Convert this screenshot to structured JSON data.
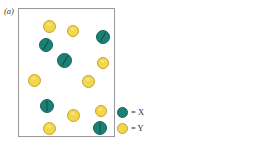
{
  "figure": {
    "type": "particle-distribution-diagram",
    "panels": [
      {
        "id": "a",
        "label": "(a)",
        "particles": [
          {
            "species": "Y",
            "x": 24,
            "y": 11,
            "d": 13,
            "slash": null
          },
          {
            "species": "Y",
            "x": 48,
            "y": 16,
            "d": 12,
            "slash": null
          },
          {
            "species": "X",
            "x": 77,
            "y": 21,
            "d": 14,
            "slash": "slash-r"
          },
          {
            "species": "X",
            "x": 20,
            "y": 29,
            "d": 14,
            "slash": "slash-r"
          },
          {
            "species": "X",
            "x": 38,
            "y": 44,
            "d": 15,
            "slash": "slash-r"
          },
          {
            "species": "Y",
            "x": 78,
            "y": 48,
            "d": 12,
            "slash": null
          },
          {
            "species": "Y",
            "x": 9,
            "y": 65,
            "d": 13,
            "slash": null
          },
          {
            "species": "Y",
            "x": 63,
            "y": 66,
            "d": 13,
            "slash": null
          },
          {
            "species": "X",
            "x": 21,
            "y": 90,
            "d": 14,
            "slash": "slash-v"
          },
          {
            "species": "Y",
            "x": 48,
            "y": 100,
            "d": 13,
            "slash": null
          },
          {
            "species": "Y",
            "x": 76,
            "y": 96,
            "d": 12,
            "slash": null
          },
          {
            "species": "Y",
            "x": 24,
            "y": 113,
            "d": 13,
            "slash": null
          },
          {
            "species": "X",
            "x": 74,
            "y": 112,
            "d": 14,
            "slash": "slash-v"
          }
        ],
        "counts": {
          "X": 5,
          "Y": 8
        }
      },
      {
        "id": "b",
        "label": "(b)",
        "particles": [
          {
            "species": "Y",
            "x": 6,
            "y": 11,
            "d": 13,
            "slash": null
          },
          {
            "species": "Y",
            "x": 33,
            "y": 6,
            "d": 13,
            "slash": null
          },
          {
            "species": "Y",
            "x": 73,
            "y": 8,
            "d": 13,
            "slash": null
          },
          {
            "species": "Y",
            "x": 27,
            "y": 24,
            "d": 13,
            "slash": null
          },
          {
            "species": "X",
            "x": 51,
            "y": 21,
            "d": 14,
            "slash": "slash-r"
          },
          {
            "species": "Y",
            "x": 5,
            "y": 35,
            "d": 12,
            "slash": null
          },
          {
            "species": "Y",
            "x": 68,
            "y": 34,
            "d": 13,
            "slash": null
          },
          {
            "species": "X",
            "x": 25,
            "y": 42,
            "d": 14,
            "slash": "slash-r"
          },
          {
            "species": "Y",
            "x": 48,
            "y": 43,
            "d": 13,
            "slash": null
          },
          {
            "species": "Y",
            "x": 8,
            "y": 61,
            "d": 13,
            "slash": null
          },
          {
            "species": "Y",
            "x": 32,
            "y": 62,
            "d": 13,
            "slash": null
          },
          {
            "species": "Y",
            "x": 50,
            "y": 69,
            "d": 13,
            "slash": null
          },
          {
            "species": "Y",
            "x": 72,
            "y": 66,
            "d": 13,
            "slash": null
          },
          {
            "species": "X",
            "x": 9,
            "y": 78,
            "d": 14,
            "slash": "slash-r"
          },
          {
            "species": "X",
            "x": 37,
            "y": 86,
            "d": 15,
            "slash": "slash-v"
          },
          {
            "species": "Y",
            "x": 7,
            "y": 97,
            "d": 13,
            "slash": null
          },
          {
            "species": "Y",
            "x": 29,
            "y": 101,
            "d": 12,
            "slash": null
          },
          {
            "species": "X",
            "x": 68,
            "y": 97,
            "d": 14,
            "slash": "slash-l"
          },
          {
            "species": "Y",
            "x": 6,
            "y": 115,
            "d": 13,
            "slash": null
          },
          {
            "species": "Y",
            "x": 54,
            "y": 116,
            "d": 13,
            "slash": null
          },
          {
            "species": "Y",
            "x": 74,
            "y": 116,
            "d": 13,
            "slash": null
          }
        ],
        "counts": {
          "X": 5,
          "Y": 16
        }
      }
    ]
  },
  "legend": {
    "entries": [
      {
        "species": "X",
        "swatch": "teal-circle-icon",
        "text": "= X",
        "color": "#1b7f72"
      },
      {
        "species": "Y",
        "swatch": "yellow-circle-icon",
        "text": "= Y",
        "color": "#f2d64b"
      }
    ]
  },
  "colors": {
    "x_fill": "#1b7f72",
    "x_stroke": "#13655b",
    "y_fill": "#f2d64b",
    "y_stroke": "#c9a227",
    "panel_border": "#9a9a9a",
    "background": "#ffffff",
    "text": "#2b2b2b"
  }
}
